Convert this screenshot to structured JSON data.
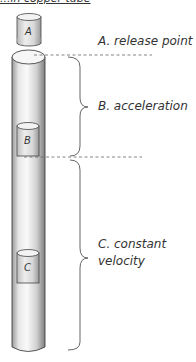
{
  "title": "...in copper tube",
  "labels": {
    "a": "A. release point",
    "b": "B. acceleration",
    "c_line1": "C. constant",
    "c_line2": "velocity"
  },
  "magnets": {
    "a": "A",
    "b": "B",
    "c": "C"
  },
  "colors": {
    "tube_light": "#f4f4f4",
    "tube_dark": "#8a8a8a",
    "outline": "#444444",
    "text": "#333333"
  }
}
